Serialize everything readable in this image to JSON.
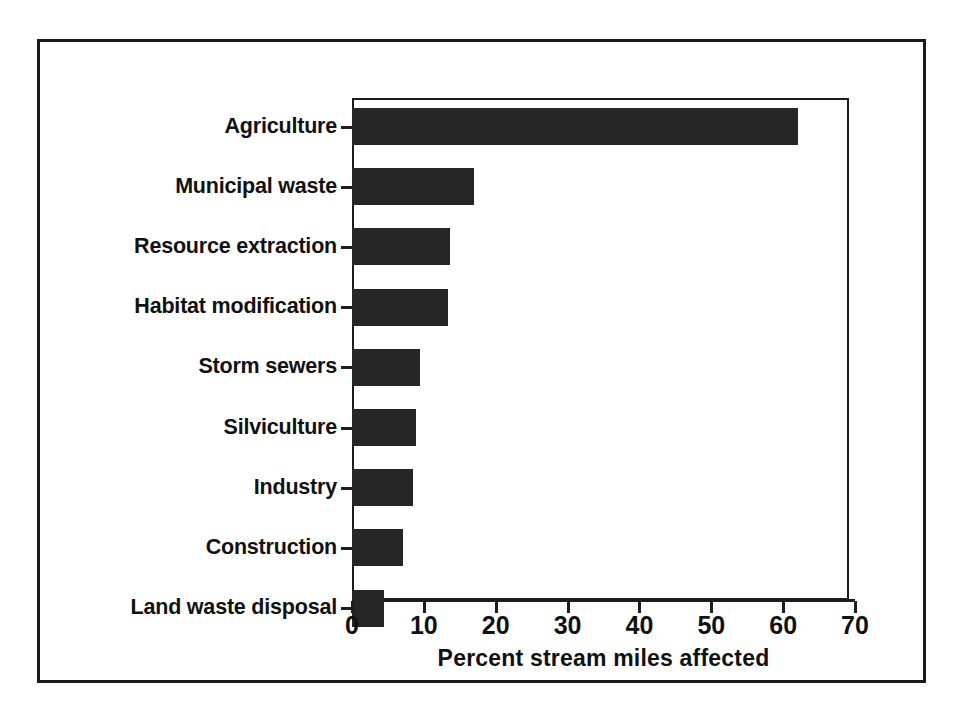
{
  "figure": {
    "frame_color": "#1a1a1a",
    "bar_color": "#262626",
    "background": "#ffffff"
  },
  "chart_data": {
    "type": "bar",
    "orientation": "horizontal",
    "title": "",
    "subtitle": "",
    "xlabel": "Percent stream miles affected",
    "ylabel": "",
    "xlim": [
      0,
      70
    ],
    "xticks": [
      0,
      10,
      20,
      30,
      40,
      50,
      60,
      70
    ],
    "xtick_labels": [
      "0",
      "10",
      "20",
      "30",
      "40",
      "50",
      "60",
      "70"
    ],
    "grid": false,
    "legend": null,
    "categories": [
      "Agriculture",
      "Municipal waste",
      "Resource extraction",
      "Habitat modification",
      "Storm sewers",
      "Silviculture",
      "Industry",
      "Construction",
      "Land waste disposal"
    ],
    "values": [
      62,
      17,
      13.7,
      13.4,
      9.5,
      8.9,
      8.5,
      7.1,
      4.5
    ],
    "units": "percent"
  }
}
